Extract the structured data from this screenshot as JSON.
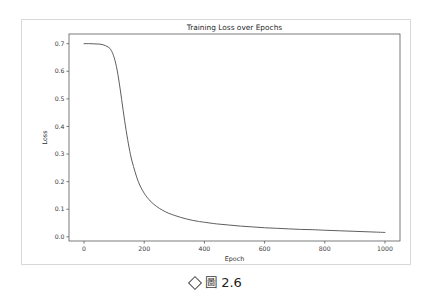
{
  "figure": {
    "caption": {
      "marker_icon": "diamond-bullet",
      "glyph": "圖",
      "number": "2.6"
    }
  },
  "chart_data": {
    "type": "line",
    "title": "Training Loss over Epochs",
    "xlabel": "Epoch",
    "ylabel": "Loss",
    "xlim": [
      -50,
      1050
    ],
    "ylim": [
      -0.015,
      0.735
    ],
    "grid": false,
    "legend": null,
    "xticks": [
      0,
      200,
      400,
      600,
      800,
      1000
    ],
    "xtick_labels": [
      "0",
      "200",
      "400",
      "600",
      "800",
      "1000"
    ],
    "yticks": [
      0.0,
      0.1,
      0.2,
      0.3,
      0.4,
      0.5,
      0.6,
      0.7
    ],
    "ytick_labels": [
      "0.0",
      "0.1",
      "0.2",
      "0.3",
      "0.4",
      "0.5",
      "0.6",
      "0.7"
    ],
    "series": [
      {
        "name": "Training Loss",
        "color": "#555555",
        "linewidth": 0.95,
        "x": [
          0,
          20,
          40,
          60,
          80,
          90,
          100,
          110,
          120,
          130,
          140,
          150,
          160,
          180,
          200,
          220,
          240,
          260,
          280,
          300,
          320,
          340,
          360,
          380,
          400,
          440,
          480,
          520,
          560,
          600,
          640,
          680,
          720,
          760,
          800,
          850,
          900,
          950,
          1000
        ],
        "y": [
          0.7,
          0.7,
          0.699,
          0.697,
          0.688,
          0.676,
          0.65,
          0.604,
          0.536,
          0.458,
          0.385,
          0.322,
          0.272,
          0.201,
          0.158,
          0.13,
          0.111,
          0.097,
          0.086,
          0.078,
          0.071,
          0.065,
          0.06,
          0.056,
          0.053,
          0.047,
          0.043,
          0.039,
          0.036,
          0.033,
          0.031,
          0.029,
          0.027,
          0.026,
          0.024,
          0.022,
          0.02,
          0.018,
          0.016
        ]
      }
    ]
  }
}
